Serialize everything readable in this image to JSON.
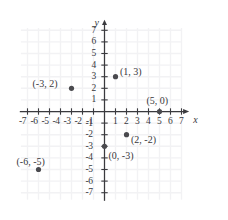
{
  "chart_data": {
    "type": "scatter",
    "title": "",
    "xlabel": "x",
    "ylabel": "y",
    "xlim": [
      -7.8,
      7.8
    ],
    "ylim": [
      -7.8,
      7.8
    ],
    "grid": true,
    "legend": "none",
    "x_ticks": [
      -7,
      -6,
      -5,
      -4,
      -3,
      -2,
      -1,
      1,
      2,
      3,
      4,
      5,
      6,
      7
    ],
    "y_ticks": [
      7,
      6,
      5,
      4,
      3,
      2,
      1,
      -1,
      -2,
      -3,
      -4,
      -5,
      -6,
      -7
    ],
    "x_tick_labels": [
      "-7",
      "-6",
      "-5",
      "-4",
      "-3",
      "-2",
      "-1",
      "1",
      "2",
      "3",
      "4",
      "5",
      "6",
      "7"
    ],
    "y_tick_labels": [
      "7",
      "6",
      "5",
      "4",
      "3",
      "2",
      "1",
      "-1",
      "-2",
      "-3",
      "-4",
      "-5",
      "-6",
      "-7"
    ],
    "points": [
      {
        "label": "(1, 3)",
        "x": 1,
        "y": 3,
        "label_pos": "right"
      },
      {
        "label": "(-3, 2)",
        "x": -3,
        "y": 2,
        "label_pos": "left"
      },
      {
        "label": "(5, 0)",
        "x": 5,
        "y": 0,
        "label_pos": "above"
      },
      {
        "label": "(2, -2)",
        "x": 2,
        "y": -2,
        "label_pos": "right"
      },
      {
        "label": "(0, -3)",
        "x": 0,
        "y": -3,
        "label_pos": "right-below"
      },
      {
        "label": "(-6, -5)",
        "x": -6,
        "y": -5,
        "label_pos": "above"
      }
    ],
    "colors": {
      "point": "#4a4a4e",
      "axis": "#3a3a3e",
      "grid": "#f2f2f4",
      "text": "#38383c",
      "background": "#ffffff"
    }
  }
}
